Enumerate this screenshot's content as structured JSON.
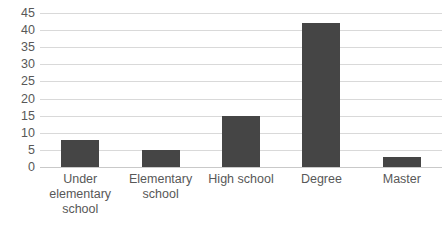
{
  "chart_data": {
    "type": "bar",
    "title": "",
    "xlabel": "",
    "ylabel": "",
    "categories": [
      "Under elementary school",
      "Elementary school",
      "High school",
      "Degree",
      "Master"
    ],
    "values": [
      8,
      5,
      15,
      42,
      3
    ],
    "ylim": [
      0,
      45
    ],
    "ytick_step": 5,
    "yticks": [
      45,
      40,
      35,
      30,
      25,
      20,
      15,
      10,
      5,
      0
    ],
    "ytick_labels": [
      "45",
      "40",
      "35",
      "30",
      "25",
      "20",
      "15",
      "10",
      "5",
      "0"
    ],
    "grid": true,
    "grid_axis": "y",
    "legend": false,
    "legend_position": "none",
    "series": [
      {
        "name": "",
        "values": [
          8,
          5,
          15,
          42,
          3
        ]
      }
    ],
    "colors": {
      "bar": "#454545",
      "gridline": "#d9d9d9",
      "axis_text": "#585858",
      "background": "#ffffff"
    }
  }
}
